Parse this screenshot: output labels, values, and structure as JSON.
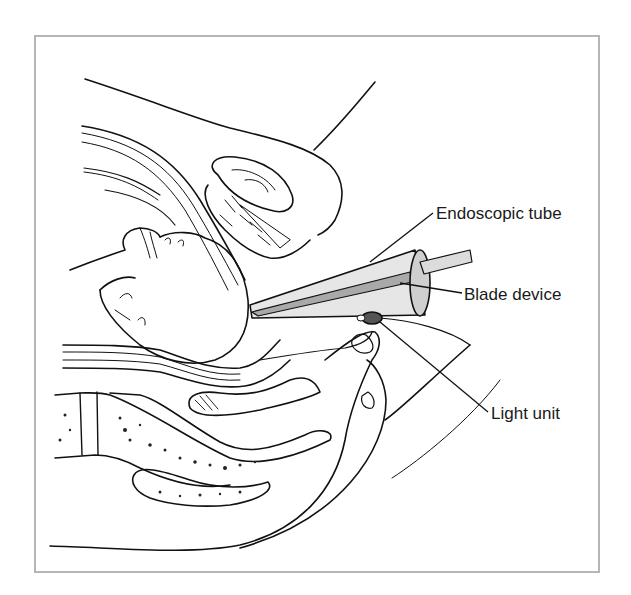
{
  "figure": {
    "style": "black line art with grey-shaded instrument",
    "colors": {
      "line": "#111111",
      "frame_border": "#b5b5b5",
      "tube_fill": "#e6e6e6",
      "blade_fill": "#a9a9a9",
      "light_fill": "#555555",
      "background": "#ffffff"
    }
  },
  "labels": [
    {
      "id": "endoscopic-tube",
      "text": "Endoscopic tube"
    },
    {
      "id": "blade-device",
      "text": "Blade device"
    },
    {
      "id": "light-unit",
      "text": "Light unit"
    }
  ]
}
